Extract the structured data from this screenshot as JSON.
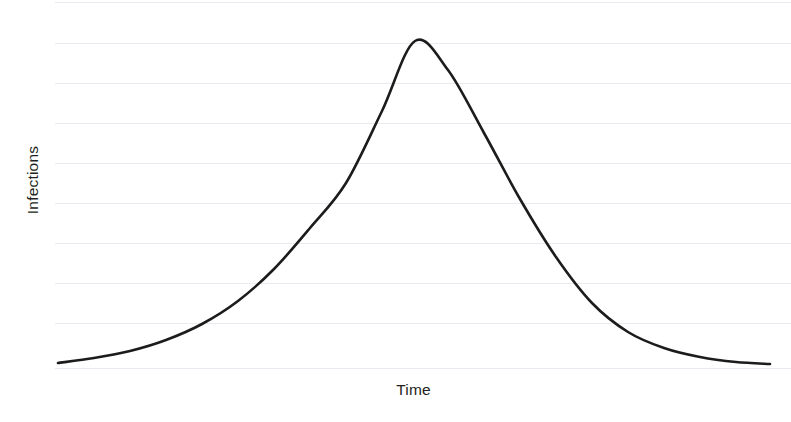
{
  "chart_data": {
    "type": "line",
    "title": "",
    "subtitle": "",
    "xlabel": "Time",
    "ylabel": "Infections",
    "legend": [],
    "annotations": [],
    "grid": {
      "horizontal": true,
      "vertical": false,
      "color": "#e9ebf0",
      "count": 10,
      "y_pixels": [
        2,
        43,
        83,
        123,
        163,
        203,
        243,
        283,
        323,
        368
      ]
    },
    "axis": {
      "x_ticks": [],
      "y_ticks": [],
      "xlim": [
        0,
        1
      ],
      "ylim": [
        0,
        1
      ],
      "x_pixel_range": [
        55,
        791
      ],
      "y_pixel_range": [
        368,
        2
      ]
    },
    "series": [
      {
        "name": "Infections",
        "color": "#1c1c1c",
        "line_width": 2.6,
        "shape": "gaussian-bell",
        "peak": {
          "x": 0.486,
          "y": 1.0
        },
        "x": [
          0.0,
          0.05,
          0.1,
          0.15,
          0.2,
          0.25,
          0.3,
          0.35,
          0.4,
          0.45,
          0.486,
          0.5,
          0.55,
          0.6,
          0.65,
          0.7,
          0.75,
          0.8,
          0.85,
          0.9,
          0.95,
          1.0
        ],
        "values": [
          0.014,
          0.024,
          0.042,
          0.072,
          0.121,
          0.196,
          0.302,
          0.44,
          0.598,
          0.752,
          0.838,
          0.866,
          0.94,
          0.966,
          0.94,
          0.866,
          0.752,
          0.598,
          0.44,
          0.302,
          0.196,
          0.012
        ],
        "points_pixels": [
          [
            58,
            363
          ],
          [
            94,
            358
          ],
          [
            130,
            351
          ],
          [
            166,
            340
          ],
          [
            202,
            324
          ],
          [
            238,
            301
          ],
          [
            274,
            269
          ],
          [
            310,
            228
          ],
          [
            346,
            183
          ],
          [
            382,
            111
          ],
          [
            415,
            41
          ],
          [
            448,
            70
          ],
          [
            484,
            133
          ],
          [
            520,
            199
          ],
          [
            556,
            257
          ],
          [
            592,
            303
          ],
          [
            628,
            332
          ],
          [
            664,
            348
          ],
          [
            700,
            357
          ],
          [
            736,
            362
          ],
          [
            770,
            364
          ]
        ]
      }
    ]
  },
  "labels": {
    "y_axis": "Infections",
    "x_axis": "Time"
  },
  "colors": {
    "curve": "#1c1c1c",
    "grid": "#e9ebf0",
    "text": "#231f20",
    "background": "#ffffff"
  }
}
